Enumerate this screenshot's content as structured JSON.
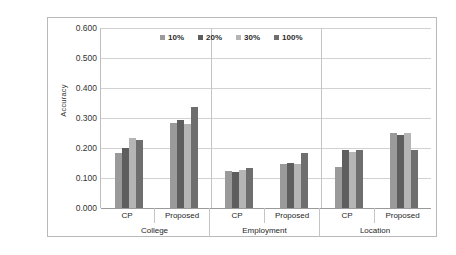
{
  "chart_data": {
    "type": "bar",
    "title": "",
    "xlabel": "",
    "ylabel": "Accuracy",
    "ylim": [
      0.0,
      0.6
    ],
    "ytick_labels": [
      "0.600",
      "0.500",
      "0.400",
      "0.300",
      "0.200",
      "0.100",
      "0.000"
    ],
    "ytick_values": [
      0.6,
      0.5,
      0.4,
      0.3,
      0.2,
      0.1,
      0.0
    ],
    "grid": true,
    "legend_position": "top-center",
    "group_labels": [
      "College",
      "Employment",
      "Location"
    ],
    "subgroup_labels": [
      "CP",
      "Proposed"
    ],
    "categories": [
      "College / CP",
      "College / Proposed",
      "Employment / CP",
      "Employment / Proposed",
      "Location / CP",
      "Location / Proposed"
    ],
    "series": [
      {
        "name": "10%",
        "color": "#9a9a9a",
        "values": [
          0.185,
          0.283,
          0.122,
          0.148,
          0.137,
          0.25
        ]
      },
      {
        "name": "20%",
        "color": "#5e5e5e",
        "values": [
          0.2,
          0.295,
          0.12,
          0.15,
          0.192,
          0.243
        ]
      },
      {
        "name": "30%",
        "color": "#b5b5b5",
        "values": [
          0.232,
          0.28,
          0.127,
          0.148,
          0.188,
          0.25
        ]
      },
      {
        "name": "100%",
        "color": "#6e6e6e",
        "values": [
          0.228,
          0.338,
          0.135,
          0.185,
          0.192,
          0.195
        ]
      }
    ]
  },
  "colors": {
    "frame_border": "#b9b9b9",
    "gridline": "#d2d2d2",
    "axis": "#9a9a9a",
    "text": "#333333"
  }
}
